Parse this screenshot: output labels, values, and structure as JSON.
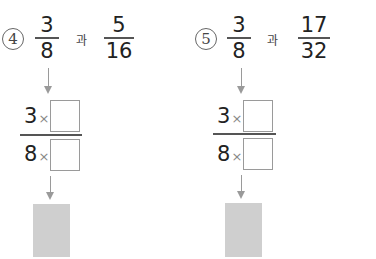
{
  "problems": [
    {
      "number": "4",
      "frac1": {
        "num": "3",
        "den": "8"
      },
      "connector": "과",
      "frac2": {
        "num": "5",
        "den": "16"
      },
      "expr": {
        "num_factor": "3",
        "den_factor": "8",
        "op": "×",
        "num_box": "",
        "den_box": ""
      },
      "answer_box": ""
    },
    {
      "number": "5",
      "frac1": {
        "num": "3",
        "den": "8"
      },
      "connector": "과",
      "frac2": {
        "num": "17",
        "den": "32"
      },
      "expr": {
        "num_factor": "3",
        "den_factor": "8",
        "op": "×",
        "num_box": "",
        "den_box": ""
      },
      "answer_box": ""
    }
  ],
  "colors": {
    "answer_fill": "#cfcfcf",
    "arrow": "#9a9a9a"
  }
}
